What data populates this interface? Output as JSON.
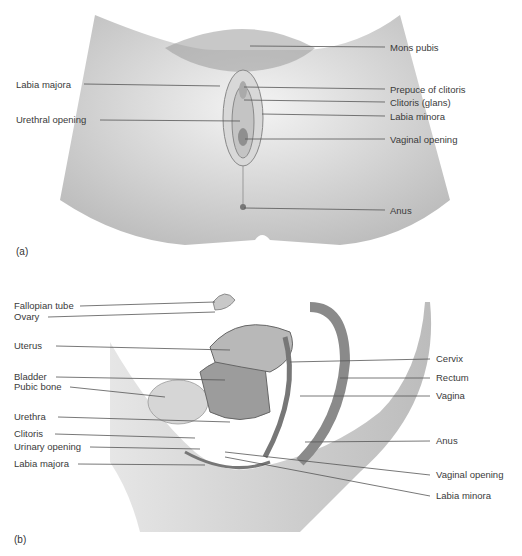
{
  "panel_a": {
    "letter": "(a)",
    "labels": [
      {
        "text": "Mons pubis",
        "x": 390,
        "y": 42
      },
      {
        "text": "Labia majora",
        "x": 16,
        "y": 79
      },
      {
        "text": "Prepuce of clitoris",
        "x": 390,
        "y": 84
      },
      {
        "text": "Clitoris (glans)",
        "x": 390,
        "y": 97
      },
      {
        "text": "Urethral opening",
        "x": 16,
        "y": 114
      },
      {
        "text": "Labia minora",
        "x": 390,
        "y": 111
      },
      {
        "text": "Vaginal opening",
        "x": 390,
        "y": 134
      },
      {
        "text": "Anus",
        "x": 390,
        "y": 205
      }
    ]
  },
  "panel_b": {
    "letter": "(b)",
    "labels": [
      {
        "text": "Fallopian tube",
        "x": 14,
        "y": 40
      },
      {
        "text": "Ovary",
        "x": 14,
        "y": 51
      },
      {
        "text": "Uterus",
        "x": 14,
        "y": 80
      },
      {
        "text": "Bladder",
        "x": 14,
        "y": 111
      },
      {
        "text": "Pubic bone",
        "x": 14,
        "y": 121
      },
      {
        "text": "Urethra",
        "x": 14,
        "y": 151
      },
      {
        "text": "Clitoris",
        "x": 14,
        "y": 168
      },
      {
        "text": "Urinary opening",
        "x": 14,
        "y": 181
      },
      {
        "text": "Labia majora",
        "x": 14,
        "y": 198
      },
      {
        "text": "Cervix",
        "x": 436,
        "y": 93
      },
      {
        "text": "Rectum",
        "x": 436,
        "y": 112
      },
      {
        "text": "Vagina",
        "x": 436,
        "y": 130
      },
      {
        "text": "Anus",
        "x": 436,
        "y": 175
      },
      {
        "text": "Vaginal opening",
        "x": 436,
        "y": 209
      },
      {
        "text": "Labia minora",
        "x": 436,
        "y": 230
      }
    ]
  }
}
